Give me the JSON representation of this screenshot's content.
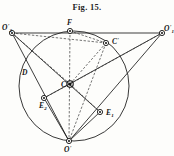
{
  "figure": {
    "title": "Fig. 15.",
    "caption_position": "top-center",
    "background_color": "#fdfdfb",
    "ink_color": "#151515"
  },
  "geometry": {
    "circle": {
      "name": "main-circle",
      "cx": 74,
      "cy": 86,
      "r": 55,
      "stroke": "#222222",
      "stroke_width": 0.9
    },
    "points": [
      {
        "id": "O2p",
        "label": "O",
        "prime": "'",
        "sub": "2",
        "x": 12,
        "y": 33,
        "marker": "small-circle"
      },
      {
        "id": "O1p",
        "label": "O",
        "prime": "'",
        "sub": "1",
        "x": 162,
        "y": 33,
        "marker": "small-circle"
      },
      {
        "id": "Op",
        "label": "O",
        "prime": "'",
        "sub": "",
        "x": 69,
        "y": 141,
        "marker": "small-circle"
      },
      {
        "id": "F",
        "label": "F",
        "prime": "",
        "sub": "",
        "x": 70,
        "y": 31,
        "marker": "small-circle"
      },
      {
        "id": "C",
        "label": "C",
        "prime": "'",
        "sub": "",
        "x": 106,
        "y": 43,
        "marker": "small-circle"
      },
      {
        "id": "Ctr",
        "label": "C",
        "prime": "",
        "sub": "",
        "x": 70,
        "y": 84,
        "marker": "hub"
      },
      {
        "id": "E2",
        "label": "E",
        "prime": "",
        "sub": "2",
        "x": 44,
        "y": 98,
        "marker": "small-circle"
      },
      {
        "id": "E1",
        "label": "E",
        "prime": "",
        "sub": "1",
        "x": 100,
        "y": 112,
        "marker": "small-circle"
      },
      {
        "id": "D",
        "label": "D",
        "prime": "",
        "sub": "",
        "x": 24,
        "y": 72,
        "marker": "none"
      }
    ],
    "solid_lines": [
      {
        "name": "line-O2p-O1p",
        "from": "O2p",
        "to": "O1p"
      },
      {
        "name": "line-O2p-E1",
        "from": "O2p",
        "to": "E1"
      },
      {
        "name": "line-O1p-E2",
        "from": "O1p",
        "to": "E2"
      },
      {
        "name": "line-O2p-Op",
        "from": "O2p",
        "to": "Op"
      },
      {
        "name": "line-O1p-Op",
        "from": "O1p",
        "to": "Op"
      },
      {
        "name": "line-E1-Op",
        "from": "E1",
        "to": "Op"
      },
      {
        "name": "line-E2-Op",
        "from": "E2",
        "to": "Op"
      }
    ],
    "dashed_lines": [
      {
        "name": "dash-O2p-C",
        "from": "O2p",
        "to": "C"
      },
      {
        "name": "dash-F-C",
        "from": "F",
        "to": "C"
      },
      {
        "name": "dash-C-Ctr",
        "from": "C",
        "to": "Ctr"
      },
      {
        "name": "dash-Ctr-O1p",
        "from": "Ctr",
        "to": "O1p"
      },
      {
        "name": "dash-Ctr-O2p",
        "from": "Ctr",
        "to": "O2p"
      },
      {
        "name": "dash-Ctr-E2",
        "from": "Ctr",
        "to": "E2"
      },
      {
        "name": "dash-Ctr-E1",
        "from": "Ctr",
        "to": "E1"
      },
      {
        "name": "dash-F-Op",
        "from": "F",
        "to": "Op"
      },
      {
        "name": "dash-C-Op",
        "from": "C",
        "to": "Op"
      }
    ]
  },
  "labels": {
    "O2p": {
      "text": "O",
      "prime": "'",
      "sub": "2",
      "tx": 2,
      "ty": 30
    },
    "O1p": {
      "text": "O",
      "prime": "'",
      "sub": "1",
      "tx": 164,
      "ty": 31
    },
    "Op": {
      "text": "O",
      "prime": "'",
      "sub": "",
      "tx": 64,
      "ty": 152
    },
    "F": {
      "text": "F",
      "prime": "",
      "sub": "",
      "tx": 67,
      "ty": 25
    },
    "C": {
      "text": "C",
      "prime": "'",
      "sub": "",
      "tx": 112,
      "ty": 44
    },
    "Ctr": {
      "text": "C",
      "prime": "",
      "sub": "",
      "tx": 61,
      "ty": 87
    },
    "E2": {
      "text": "E",
      "prime": "",
      "sub": "2",
      "tx": 39,
      "ty": 108
    },
    "E1": {
      "text": "E",
      "prime": "",
      "sub": "1",
      "tx": 106,
      "ty": 115
    },
    "D": {
      "text": "D",
      "prime": "",
      "sub": "",
      "tx": 22,
      "ty": 75
    }
  }
}
